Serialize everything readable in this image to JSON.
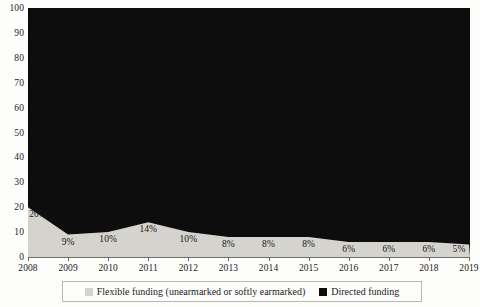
{
  "chart_data": {
    "type": "area",
    "title": "",
    "subtitle": "",
    "xlabel": "",
    "ylabel": "",
    "ylim": [
      0,
      100
    ],
    "yticks": [
      0,
      10,
      20,
      30,
      40,
      50,
      60,
      70,
      80,
      90,
      100
    ],
    "ytick_labels": [
      "0",
      "10",
      "20",
      "30",
      "40",
      "50",
      "60",
      "70",
      "80",
      "90",
      "100"
    ],
    "grid": false,
    "stacked": true,
    "legend_position": "bottom",
    "categories": [
      "2008",
      "2009",
      "2010",
      "2011",
      "2012",
      "2013",
      "2014",
      "2015",
      "2016",
      "2017",
      "2018",
      "2019"
    ],
    "x": [
      2008,
      2009,
      2010,
      2011,
      2012,
      2013,
      2014,
      2015,
      2016,
      2017,
      2018,
      2019
    ],
    "series": [
      {
        "name": "Flexible funding (unearmarked or softly earmarked)",
        "color": "#d5d3ce",
        "values": [
          20,
          9,
          10,
          14,
          10,
          8,
          8,
          8,
          6,
          6,
          6,
          5
        ],
        "data_labels": [
          "20%",
          "9%",
          "10%",
          "14%",
          "10%",
          "8%",
          "8%",
          "8%",
          "6%",
          "6%",
          "6%",
          "5%"
        ]
      },
      {
        "name": "Directed funding",
        "color": "#0d0d0d",
        "values": [
          80,
          91,
          90,
          86,
          90,
          92,
          92,
          92,
          94,
          94,
          94,
          95
        ],
        "data_labels": []
      }
    ]
  },
  "legend": {
    "items": [
      {
        "label": "Flexible funding (unearmarked or softly earmarked)",
        "swatch_color": "#d5d3ce"
      },
      {
        "label": "Directed funding",
        "swatch_color": "#0d0d0d"
      }
    ]
  }
}
